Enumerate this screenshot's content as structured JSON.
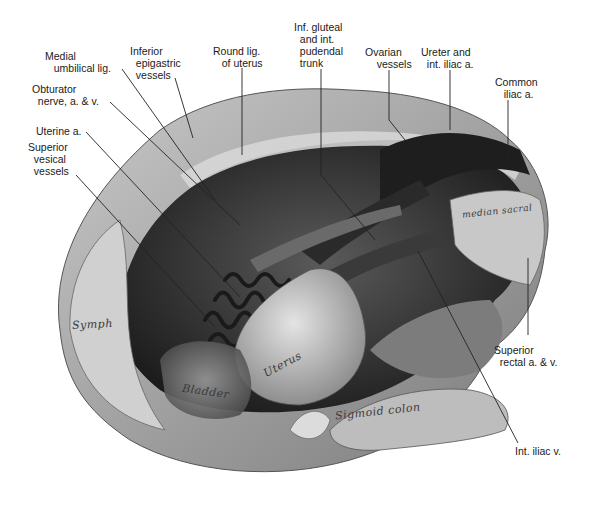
{
  "figure": {
    "callout_labels": [
      {
        "id": "medial-umbilical-lig",
        "text": "Medial\n   umbilical lig."
      },
      {
        "id": "inferior-epigastric-vessels",
        "text": "Inferior\n  epigastric\n  vessels"
      },
      {
        "id": "round-lig-of-uterus",
        "text": "Round lig.\n   of uterus"
      },
      {
        "id": "inf-gluteal-pudendal-trunk",
        "text": "Inf. gluteal\n  and int.\n  pudendal\n  trunk"
      },
      {
        "id": "ovarian-vessels",
        "text": "Ovarian\n    vessels"
      },
      {
        "id": "ureter-int-iliac-a",
        "text": "Ureter and\n  int. iliac a."
      },
      {
        "id": "common-iliac-a",
        "text": "Common\n   iliac a."
      },
      {
        "id": "obturator-nerve",
        "text": "Obturator\n  nerve, a. & v."
      },
      {
        "id": "uterine-a",
        "text": "Uterine a."
      },
      {
        "id": "superior-vesical-vessels",
        "text": "Superior\n  vesical\n  vessels"
      },
      {
        "id": "superior-rectal",
        "text": "Superior\n  rectal a. & v."
      },
      {
        "id": "int-iliac-v",
        "text": "Int. iliac v."
      }
    ],
    "structure_labels": [
      {
        "id": "symph",
        "text": "Symph"
      },
      {
        "id": "bladder",
        "text": "Bladder"
      },
      {
        "id": "uterus",
        "text": "Uterus"
      },
      {
        "id": "sigmoid-colon",
        "text": "Sigmoid colon"
      },
      {
        "id": "median-sacral",
        "text": "median sacral"
      }
    ]
  }
}
